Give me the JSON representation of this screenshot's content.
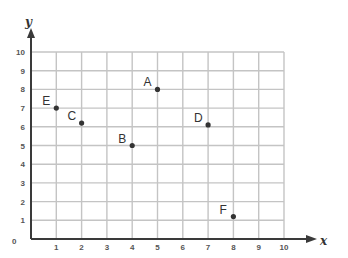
{
  "chart_data": {
    "type": "scatter",
    "title": "",
    "xlabel": "x",
    "ylabel": "y",
    "xlim": [
      0,
      10
    ],
    "ylim": [
      0,
      10
    ],
    "grid": true,
    "x_ticks": [
      "1",
      "2",
      "3",
      "4",
      "5",
      "6",
      "7",
      "8",
      "9",
      "10"
    ],
    "y_ticks": [
      "1",
      "2",
      "3",
      "4",
      "5",
      "6",
      "7",
      "8",
      "9",
      "10"
    ],
    "origin_label": "0",
    "points": [
      {
        "label": "A",
        "x": 5,
        "y": 8
      },
      {
        "label": "B",
        "x": 4,
        "y": 5
      },
      {
        "label": "C",
        "x": 2,
        "y": 6.2
      },
      {
        "label": "D",
        "x": 7,
        "y": 6.1
      },
      {
        "label": "E",
        "x": 1,
        "y": 7
      },
      {
        "label": "F",
        "x": 8,
        "y": 1.2
      }
    ]
  },
  "colors": {
    "grid": "#c4c4c4",
    "axis": "#3a3a3a",
    "point": "#333333"
  }
}
